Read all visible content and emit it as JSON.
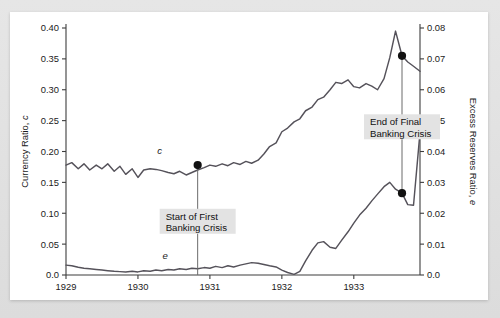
{
  "chart_data": {
    "type": "line",
    "title": "",
    "xlabel": "",
    "ylabel": "Currency Ratio, c",
    "y2label": "Excess Reserves Ratio, e",
    "grid": false,
    "legend": "inline-curve-labels",
    "xlim": [
      1929.0,
      1933.92
    ],
    "ylim": [
      0.0,
      0.4
    ],
    "y2lim": [
      0.0,
      0.08
    ],
    "x_tick_labels": [
      "1929",
      "1930",
      "1931",
      "1932",
      "1933"
    ],
    "x_tick_values": [
      1929,
      1930,
      1931,
      1932,
      1933
    ],
    "y_tick_labels": [
      "0.0",
      "0.05",
      "0.10",
      "0.15",
      "0.20",
      "0.25",
      "0.30",
      "0.35",
      "0.40"
    ],
    "y_tick_values": [
      0.0,
      0.05,
      0.1,
      0.15,
      0.2,
      0.25,
      0.3,
      0.35,
      0.4
    ],
    "y2_tick_labels": [
      "0.0",
      "0.01",
      "0.02",
      "0.03",
      "0.04",
      "0.05",
      "0.06",
      "0.07",
      "0.08"
    ],
    "y2_tick_values": [
      0.0,
      0.01,
      0.02,
      0.03,
      0.04,
      0.05,
      0.06,
      0.07,
      0.08
    ],
    "series": [
      {
        "name": "c",
        "label": "c",
        "axis": "left",
        "color": "#55525a",
        "label_point": {
          "x": 1930.3,
          "y": 0.196
        },
        "x": [
          1929.0,
          1929.08,
          1929.17,
          1929.25,
          1929.33,
          1929.42,
          1929.5,
          1929.58,
          1929.67,
          1929.75,
          1929.83,
          1929.92,
          1930.0,
          1930.08,
          1930.17,
          1930.25,
          1930.33,
          1930.42,
          1930.5,
          1930.58,
          1930.67,
          1930.75,
          1930.83,
          1930.92,
          1931.0,
          1931.08,
          1931.17,
          1931.25,
          1931.33,
          1931.42,
          1931.5,
          1931.58,
          1931.67,
          1931.75,
          1931.83,
          1931.92,
          1932.0,
          1932.08,
          1932.17,
          1932.25,
          1932.33,
          1932.42,
          1932.5,
          1932.58,
          1932.67,
          1932.75,
          1932.83,
          1932.92,
          1933.0,
          1933.08,
          1933.17,
          1933.25,
          1933.33,
          1933.42,
          1933.5,
          1933.58,
          1933.67,
          1933.75,
          1933.83,
          1933.92
        ],
        "y": [
          0.178,
          0.182,
          0.172,
          0.18,
          0.17,
          0.178,
          0.172,
          0.18,
          0.168,
          0.176,
          0.163,
          0.172,
          0.158,
          0.17,
          0.172,
          0.171,
          0.169,
          0.166,
          0.164,
          0.168,
          0.162,
          0.166,
          0.17,
          0.174,
          0.178,
          0.176,
          0.18,
          0.177,
          0.182,
          0.179,
          0.184,
          0.181,
          0.186,
          0.196,
          0.208,
          0.214,
          0.232,
          0.238,
          0.248,
          0.253,
          0.266,
          0.272,
          0.284,
          0.288,
          0.3,
          0.312,
          0.31,
          0.316,
          0.305,
          0.303,
          0.31,
          0.306,
          0.3,
          0.318,
          0.352,
          0.395,
          0.355,
          0.345,
          0.338,
          0.33
        ],
        "markers": [
          {
            "x": 1930.83,
            "y": 0.178,
            "label": "Start of First Banking Crisis"
          },
          {
            "x": 1933.67,
            "y": 0.355,
            "label": "End of Final Banking Crisis"
          }
        ]
      },
      {
        "name": "e",
        "label": "e",
        "axis": "right",
        "color": "#55525a",
        "label_point": {
          "x": 1930.38,
          "y": 0.0052
        },
        "x": [
          1929.0,
          1929.08,
          1929.17,
          1929.25,
          1929.33,
          1929.42,
          1929.5,
          1929.58,
          1929.67,
          1929.75,
          1929.83,
          1929.92,
          1930.0,
          1930.08,
          1930.17,
          1930.25,
          1930.33,
          1930.42,
          1930.5,
          1930.58,
          1930.67,
          1930.75,
          1930.83,
          1930.92,
          1931.0,
          1931.08,
          1931.17,
          1931.25,
          1931.33,
          1931.42,
          1931.5,
          1931.58,
          1931.67,
          1931.75,
          1931.83,
          1931.92,
          1932.0,
          1932.08,
          1932.17,
          1932.25,
          1932.33,
          1932.42,
          1932.5,
          1932.58,
          1932.67,
          1932.75,
          1932.83,
          1932.92,
          1933.0,
          1933.08,
          1933.17,
          1933.25,
          1933.33,
          1933.42,
          1933.5,
          1933.58,
          1933.67,
          1933.75,
          1933.83,
          1933.92
        ],
        "y": [
          0.0032,
          0.003,
          0.0025,
          0.0022,
          0.002,
          0.0018,
          0.0016,
          0.0014,
          0.0012,
          0.0011,
          0.001,
          0.0012,
          0.001,
          0.0014,
          0.0012,
          0.0016,
          0.0014,
          0.0018,
          0.0016,
          0.002,
          0.0018,
          0.0022,
          0.002,
          0.0024,
          0.0022,
          0.0028,
          0.0024,
          0.003,
          0.0026,
          0.0032,
          0.0036,
          0.004,
          0.0038,
          0.0034,
          0.003,
          0.0026,
          0.0016,
          0.0008,
          0.0002,
          0.0012,
          0.0046,
          0.008,
          0.0104,
          0.0108,
          0.009,
          0.0086,
          0.0112,
          0.014,
          0.0168,
          0.0194,
          0.0216,
          0.024,
          0.0262,
          0.0286,
          0.03,
          0.0278,
          0.0265,
          0.0228,
          0.0226,
          0.0462
        ],
        "markers": [
          {
            "x": 1933.67,
            "y": 0.0265,
            "label": "End of Final Banking Crisis"
          }
        ]
      }
    ],
    "annotations": [
      {
        "id": "start-first-banking-crisis",
        "lines": [
          "Start of First",
          "Banking Crisis"
        ],
        "x": 1930.83,
        "y_top": 0.178,
        "y_bottom": 0.0,
        "box_y_center": 0.087
      },
      {
        "id": "end-final-banking-crisis",
        "lines": [
          "End of Final",
          "Banking Crisis"
        ],
        "x": 1933.67,
        "y_top": 0.355,
        "y_bottom": 0.0265,
        "box_y_center": 0.24
      }
    ]
  }
}
